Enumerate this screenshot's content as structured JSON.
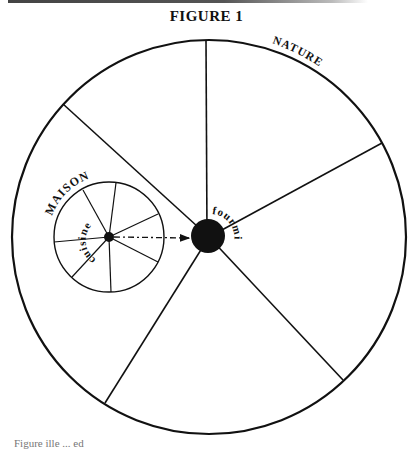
{
  "figure": {
    "title": "FIGURE 1",
    "outer_circle_label": "NATURE",
    "inner_circle_label": "MAISON",
    "inner_center_label": "cuisine",
    "outer_center_label": "fourmi",
    "bottom_cut_text": "Figure  ille  ...  ed"
  },
  "colors": {
    "ink": "#111111",
    "background": "#ffffff"
  }
}
